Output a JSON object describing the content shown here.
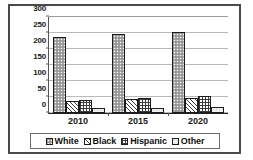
{
  "chart_data": {
    "type": "bar",
    "title": "",
    "subtitle": "",
    "xlabel": "",
    "ylabel": "",
    "categories": [
      "2010",
      "2015",
      "2020"
    ],
    "series": [
      {
        "name": "White",
        "values": [
          238,
          246,
          252
        ],
        "pattern": "speckled-gray"
      },
      {
        "name": "Black",
        "values": [
          38,
          43,
          46
        ],
        "pattern": "diagonal-hatch"
      },
      {
        "name": "Hispanic",
        "values": [
          42,
          46,
          52
        ],
        "pattern": "grid-crosshatch"
      },
      {
        "name": "Other",
        "values": [
          16,
          16,
          18
        ],
        "pattern": "light-dots"
      }
    ],
    "ylim": [
      0,
      300
    ],
    "yticks": [
      0,
      50,
      100,
      150,
      200,
      250,
      300
    ],
    "ytick_labels": [
      "0",
      "50",
      "100",
      "150",
      "200",
      "250",
      "300"
    ],
    "grid": true,
    "grid_axis": "y",
    "legend_position": "bottom",
    "legend_entries": [
      "White",
      "Black",
      "Hispanic",
      "Other"
    ]
  },
  "colors": {
    "frame_border": "#4a4a4a",
    "axis": "#222222",
    "gridline": "#b9b9b9",
    "bar_outline": "#1c1c1c",
    "white_series": "#a8a8a8",
    "black_series": "#3b3b3b",
    "hispanic_series": "#3b3b3b",
    "other_series": "#f2f2f2",
    "background": "#ffffff",
    "text": "#1a1a1a"
  }
}
